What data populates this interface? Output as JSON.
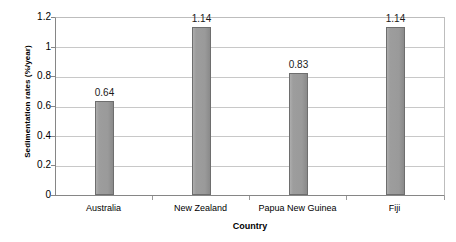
{
  "chart_data": {
    "type": "bar",
    "title": "",
    "subtitle": "",
    "xlabel": "Country",
    "ylabel": "Sedimentation rates (%/year)",
    "categories": [
      "Australia",
      "New Zealand",
      "Papua New Guinea",
      "Fiji"
    ],
    "values": [
      0.64,
      1.14,
      0.83,
      1.14
    ],
    "data_labels": [
      "0.64",
      "1.14",
      "0.83",
      "1.14"
    ],
    "ylim": [
      0,
      1.2
    ],
    "ytick_labels": [
      "1.2",
      "1",
      "0.8",
      "0.6",
      "0.4",
      "0.2",
      "0"
    ],
    "ytick_values": [
      1.2,
      1.0,
      0.8,
      0.6,
      0.4,
      0.2,
      0
    ],
    "grid": "horizontal",
    "legend": "none",
    "colors": {
      "bar_fill": "#9a9a9a",
      "bar_border": "#6e6e6e",
      "gridline": "#c8c8c8",
      "axis": "#868686",
      "text": "#000000",
      "background": "#ffffff"
    }
  }
}
